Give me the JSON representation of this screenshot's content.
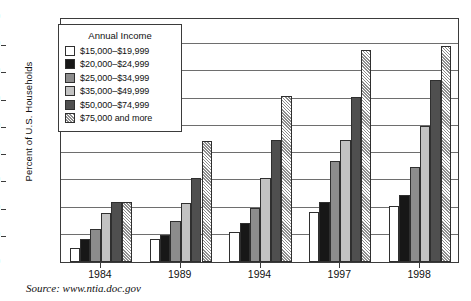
{
  "chart_data": {
    "type": "bar",
    "title": "",
    "xlabel": "",
    "ylabel": "Percent of U.S. Households",
    "ylim": [
      0,
      90
    ],
    "ytick_step": 10,
    "yticks": [
      0,
      10,
      20,
      30,
      40,
      50,
      60,
      70,
      80,
      90
    ],
    "grid": true,
    "categories": [
      "1984",
      "1989",
      "1994",
      "1997",
      "1998"
    ],
    "legend_title": "Annual Income",
    "legend_position": "upper-left-inside",
    "series": [
      {
        "name": "$15,000–$19,999",
        "swatch": "sw-a",
        "color": "#ffffff",
        "values": [
          5,
          8.5,
          11,
          18.5,
          20.5
        ]
      },
      {
        "name": "$20,000–$24,999",
        "swatch": "sw-b",
        "color": "#171717",
        "values": [
          8.5,
          10,
          14.5,
          22,
          24.5
        ]
      },
      {
        "name": "$25,000–$34,999",
        "swatch": "sw-c",
        "color": "#8c8c8c",
        "values": [
          12,
          15,
          20,
          37,
          35
        ]
      },
      {
        "name": "$35,000–$49,999",
        "swatch": "sw-d",
        "color": "#c2c2c2",
        "values": [
          18,
          21.5,
          31,
          45,
          50
        ]
      },
      {
        "name": "$50,000–$74,999",
        "swatch": "sw-e",
        "color": "#4f4f4f",
        "values": [
          22,
          31,
          45,
          60.5,
          67
        ]
      },
      {
        "name": "$75,000 and more",
        "swatch": "sw-f",
        "color": "hatched",
        "values": [
          22,
          44.5,
          61,
          78,
          79.5
        ]
      }
    ]
  },
  "source": {
    "text": "Source: www.ntia.doc.gov"
  }
}
